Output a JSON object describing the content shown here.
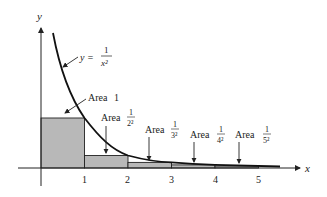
{
  "figure": {
    "y_axis_label": "y",
    "x_axis_label": "x",
    "equation": {
      "lhs": "y =",
      "num": "1",
      "den": "x²"
    },
    "ticks": [
      "1",
      "2",
      "3",
      "4",
      "5"
    ],
    "areas": [
      {
        "prefix": "Area",
        "value": "1"
      },
      {
        "prefix": "Area",
        "num": "1",
        "den": "2²"
      },
      {
        "prefix": "Area",
        "num": "1",
        "den": "3²"
      },
      {
        "prefix": "Area",
        "num": "1",
        "den": "4²"
      },
      {
        "prefix": "Area",
        "num": "1",
        "den": "5²"
      }
    ],
    "colors": {
      "rect_fill": "#b8b8b8",
      "stroke": "#222222",
      "curve": "#111111"
    }
  }
}
